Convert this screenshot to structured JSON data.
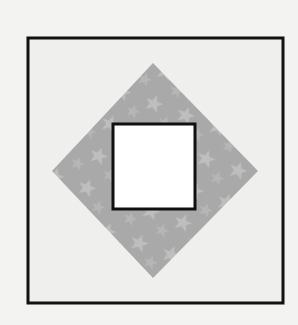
{
  "figure": {
    "colors": {
      "background": "#f3f3f1",
      "outer_square_fill": "#efefed",
      "outer_square_stroke": "#111111",
      "diamond_fill": "#a9a9a9",
      "diamond_star": "#c4c4c4",
      "inner_square_fill": "#ffffff",
      "inner_square_stroke": "#111111"
    },
    "shapes": {
      "outer_square": {
        "x": 28,
        "y": 38,
        "width": 255,
        "height": 265
      },
      "diamond": {
        "points": "153,63 258,171 153,278 52,171"
      },
      "inner_square": {
        "x": 113,
        "y": 124,
        "width": 82,
        "height": 85
      }
    }
  }
}
